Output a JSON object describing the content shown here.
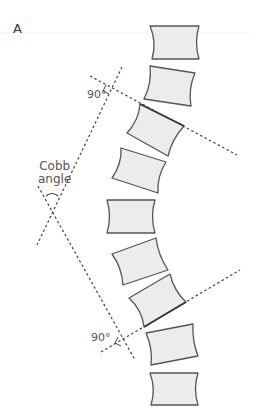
{
  "figure": {
    "panel_label": "A",
    "labels": {
      "cobb_line1": "Cobb",
      "cobb_line2": "angle",
      "angle_top": "90°",
      "angle_bottom": "90°"
    },
    "colors": {
      "vertebra_fill": "#ececec",
      "vertebra_stroke": "#555555",
      "dashed_line": "#444444",
      "text": "#555555"
    },
    "vertebrae_count": 9
  }
}
